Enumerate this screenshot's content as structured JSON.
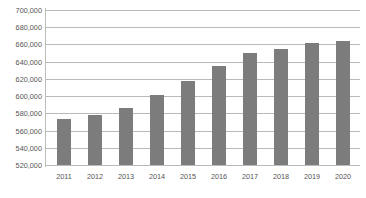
{
  "chart_data": {
    "type": "bar",
    "title": "",
    "subtitle": "",
    "xlabel": "",
    "ylabel": "",
    "categories": [
      "2011",
      "2012",
      "2013",
      "2014",
      "2015",
      "2016",
      "2017",
      "2018",
      "2019",
      "2020"
    ],
    "values": [
      574000,
      578000,
      586000,
      601000,
      618000,
      635000,
      650000,
      655000,
      662000,
      664000
    ],
    "series": [
      {
        "name": "Value",
        "values": [
          574000,
          578000,
          586000,
          601000,
          618000,
          635000,
          650000,
          655000,
          662000,
          664000
        ]
      }
    ],
    "ylim": [
      520000,
      700000
    ],
    "ytick_step": 20000,
    "ytick_labels": [
      "700,000",
      "680,000",
      "660,000",
      "640,000",
      "620,000",
      "600,000",
      "580,000",
      "560,000",
      "540,000",
      "520,000"
    ],
    "ytick_values": [
      700000,
      680000,
      660000,
      640000,
      620000,
      600000,
      580000,
      560000,
      540000,
      520000
    ],
    "grid": true,
    "grid_axis": "y",
    "legend": false,
    "legend_position": "none",
    "bar_color": "#7c7c7c",
    "grid_color": "#b9b9b9",
    "axis_color": "#bdbdbd",
    "text_color": "#555555",
    "background_color": "#ffffff"
  }
}
